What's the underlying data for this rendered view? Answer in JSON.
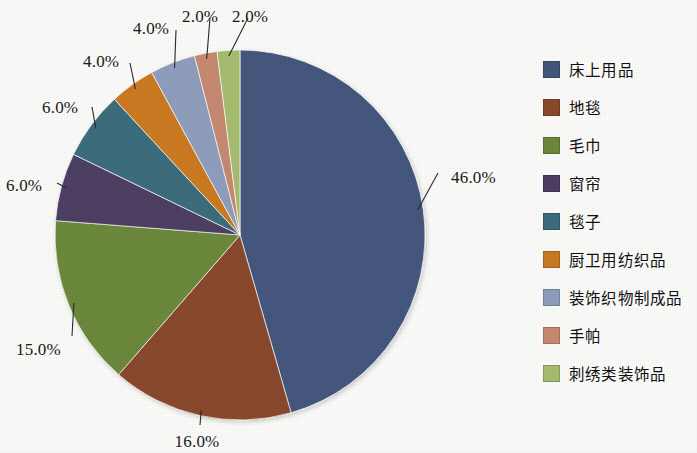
{
  "chart_data": {
    "type": "pie",
    "title": "",
    "subtitle": "",
    "xlabel": "",
    "ylabel": "",
    "legend_position": "right",
    "grid": false,
    "start_angle_deg": 0,
    "direction": "clockwise",
    "categories": [
      "床上用品",
      "地毯",
      "毛巾",
      "窗帘",
      "毯子",
      "厨卫用纺织品",
      "装饰织物制成品",
      "手帕",
      "刺绣类装饰品"
    ],
    "values": [
      46.0,
      16.0,
      15.0,
      6.0,
      6.0,
      4.0,
      4.0,
      2.0,
      2.0
    ],
    "data_labels": [
      "46.0%",
      "16.0%",
      "15.0%",
      "6.0%",
      "6.0%",
      "4.0%",
      "4.0%",
      "2.0%",
      "2.0%"
    ],
    "colors": [
      "#44587f",
      "#8b4a2d",
      "#6d8a3c",
      "#4f3f63",
      "#3d6e7e",
      "#cd7b23",
      "#8fa0bf",
      "#c98a72",
      "#a8bf72"
    ]
  },
  "legend": {
    "items": [
      {
        "label": "床上用品",
        "color": "#44587f",
        "value": "46.0%"
      },
      {
        "label": "地毯",
        "color": "#8b4a2d",
        "value": "16.0%"
      },
      {
        "label": "毛巾",
        "color": "#6d8a3c",
        "value": "15.0%"
      },
      {
        "label": "窗帘",
        "color": "#4f3f63",
        "value": "6.0%"
      },
      {
        "label": "毯子",
        "color": "#3d6e7e",
        "value": "6.0%"
      },
      {
        "label": "厨卫用纺织品",
        "color": "#cd7b23",
        "value": "4.0%"
      },
      {
        "label": "装饰织物制成品",
        "color": "#8fa0bf",
        "value": "4.0%"
      },
      {
        "label": "手帕",
        "color": "#c98a72",
        "value": "2.0%"
      },
      {
        "label": "刺绣类装饰品",
        "color": "#a8bf72",
        "value": "2.0%"
      }
    ]
  },
  "geometry": {
    "center_x": 240,
    "center_y": 235,
    "radius": 185
  },
  "label_placements": [
    {
      "index": 0,
      "text": "46.0%",
      "x": 451,
      "y": 179,
      "anchor": "start",
      "elbow_x": 438,
      "elbow_y": 173
    },
    {
      "index": 1,
      "text": "16.0%",
      "x": 197,
      "y": 443,
      "anchor": "middle",
      "elbow_x": 200,
      "elbow_y": 425
    },
    {
      "index": 2,
      "text": "15.0%",
      "x": 16,
      "y": 351,
      "anchor": "start",
      "elbow_x": 72,
      "elbow_y": 336
    },
    {
      "index": 3,
      "text": "6.0%",
      "x": 6,
      "y": 187,
      "anchor": "start",
      "elbow_x": 57,
      "elbow_y": 183
    },
    {
      "index": 4,
      "text": "6.0%",
      "x": 42,
      "y": 109,
      "anchor": "start",
      "elbow_x": 92,
      "elbow_y": 107
    },
    {
      "index": 5,
      "text": "4.0%",
      "x": 83,
      "y": 63,
      "anchor": "start",
      "elbow_x": 130,
      "elbow_y": 63
    },
    {
      "index": 6,
      "text": "4.0%",
      "x": 133,
      "y": 30,
      "anchor": "start",
      "elbow_x": 176,
      "elbow_y": 30
    },
    {
      "index": 7,
      "text": "2.0%",
      "x": 182,
      "y": 18,
      "anchor": "start",
      "elbow_x": 210,
      "elbow_y": 18
    },
    {
      "index": 8,
      "text": "2.0%",
      "x": 232,
      "y": 18,
      "anchor": "start",
      "elbow_x": 248,
      "elbow_y": 18
    }
  ]
}
